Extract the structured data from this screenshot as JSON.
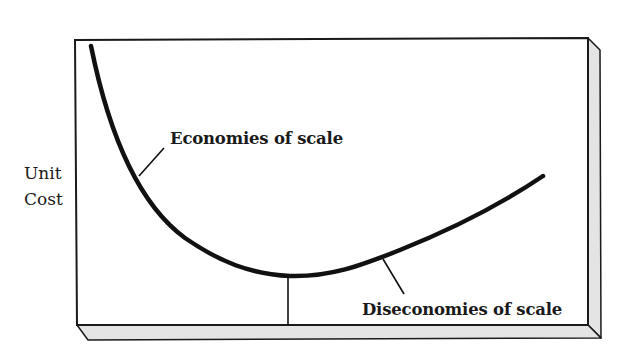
{
  "diagram": {
    "type": "u-shaped cost curve",
    "y_axis_label": [
      "Unit",
      "Cost"
    ],
    "annotations": {
      "economies": "Economies of scale",
      "diseconomies": "Diseconomies of scale"
    },
    "curve": {
      "description": "Long-run average cost curve: steeply falling, reaching a minimum, then gently rising",
      "min_marker": "vertical line from curve minimum to horizontal axis"
    },
    "colors": {
      "line": "#111111",
      "frame": "#1a1a1a",
      "slab_fill": "#e4e4e4",
      "background": "#ffffff"
    }
  }
}
